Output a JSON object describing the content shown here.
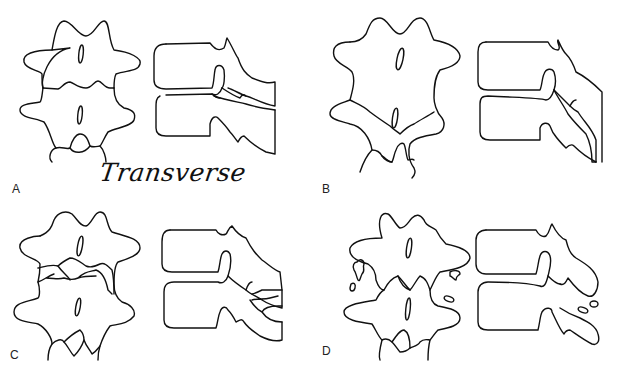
{
  "figure": {
    "caption": "Transverse",
    "panels": [
      {
        "id": "A",
        "label": "A",
        "description": "Intact vertebrae, posterior and lateral views"
      },
      {
        "id": "B",
        "label": "B",
        "description": "Fracture through lamina, posterior and lateral views"
      },
      {
        "id": "C",
        "label": "C",
        "description": "Oblique fracture of posterior elements"
      },
      {
        "id": "D",
        "label": "D",
        "description": "Comminuted fragments of transverse processes"
      }
    ],
    "colors": {
      "line": "#111111",
      "background": "#ffffff"
    }
  }
}
